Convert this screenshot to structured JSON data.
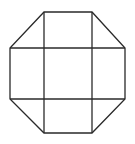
{
  "diagram": {
    "title": "",
    "type": "octagon-grid",
    "stroke_color": "#2a2a2a",
    "background": "#ffffff",
    "octagon_points": [
      [
        44,
        12
      ],
      [
        92,
        12
      ],
      [
        125,
        48
      ],
      [
        125,
        99
      ],
      [
        92,
        133
      ],
      [
        44,
        133
      ],
      [
        10,
        99
      ],
      [
        10,
        48
      ]
    ],
    "inner_lines": [
      {
        "x1": 44,
        "y1": 12,
        "x2": 44,
        "y2": 133
      },
      {
        "x1": 92,
        "y1": 12,
        "x2": 92,
        "y2": 133
      },
      {
        "x1": 10,
        "y1": 48,
        "x2": 125,
        "y2": 48
      },
      {
        "x1": 10,
        "y1": 99,
        "x2": 125,
        "y2": 99
      }
    ]
  }
}
